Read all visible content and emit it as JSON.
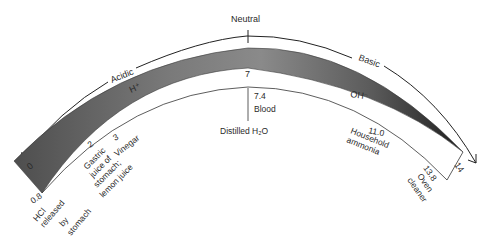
{
  "diagram": {
    "scale": {
      "top_label": "Neutral",
      "left_label": "Acidic",
      "right_label": "Basic",
      "ion_acid": "H⁺",
      "ion_base": "OH⁻",
      "min": "0",
      "mid": "7",
      "max": "14"
    },
    "markers": [
      {
        "value": "0.8",
        "lines": [
          "HCl",
          "released",
          "by",
          "stomach"
        ]
      },
      {
        "value": "2",
        "lines": [
          "Gastric",
          "juice of",
          "stomach;",
          "lemon juice"
        ]
      },
      {
        "value": "3",
        "lines": [
          "Vinegar"
        ]
      },
      {
        "value": "7.4",
        "lines": [
          "Blood"
        ]
      },
      {
        "value": "",
        "lines": [
          "Distilled H₂O"
        ]
      },
      {
        "value": "11.0",
        "lines": [
          "Household",
          "ammonia"
        ]
      },
      {
        "value": "13.8",
        "lines": [
          "Oven",
          "cleaner"
        ]
      }
    ],
    "colors": {
      "band_dark": "#5a5a5a",
      "band_mid": "#8a8a8a",
      "line": "#222222",
      "text": "#2a2a2a"
    }
  }
}
